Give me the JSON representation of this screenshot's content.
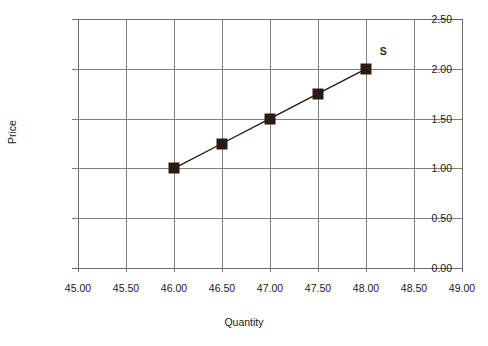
{
  "chart_data": {
    "type": "line",
    "title": "",
    "title_clipped": true,
    "xlabel": "Quantity",
    "ylabel": "Price",
    "xlim": [
      45.0,
      49.0
    ],
    "ylim": [
      0.0,
      2.5
    ],
    "xticks": [
      "45.00",
      "45.50",
      "46.00",
      "46.50",
      "47.00",
      "47.50",
      "48.00",
      "48.50",
      "49.00"
    ],
    "xtick_values": [
      45.0,
      45.5,
      46.0,
      46.5,
      47.0,
      47.5,
      48.0,
      48.5,
      49.0
    ],
    "yticks": [
      "0.00",
      "0.50",
      "1.00",
      "1.50",
      "2.00",
      "2.50"
    ],
    "ytick_values": [
      0.0,
      0.5,
      1.0,
      1.5,
      2.0,
      2.5
    ],
    "grid": true,
    "legend_position": "inline-end-label",
    "series": [
      {
        "name": "S",
        "label": "S",
        "marker": "square",
        "marker_color": "#2b1a12",
        "line_color": "#2b1a12",
        "x": [
          46.0,
          46.5,
          47.0,
          47.5,
          48.0
        ],
        "values": [
          1.0,
          1.25,
          1.5,
          1.75,
          2.0
        ],
        "points": [
          {
            "x": 46.0,
            "y": 1.0
          },
          {
            "x": 46.5,
            "y": 1.25
          },
          {
            "x": 47.0,
            "y": 1.5
          },
          {
            "x": 47.5,
            "y": 1.75
          },
          {
            "x": 48.0,
            "y": 2.0
          }
        ]
      }
    ],
    "annotations": [
      {
        "text": "S",
        "x": 48.18,
        "y": 2.18
      }
    ],
    "colors": {
      "background": "#ffffff",
      "grid": "#808080",
      "axis": "#6b6b6b",
      "text": "#1a1a1a",
      "series": "#2b1a12"
    }
  }
}
